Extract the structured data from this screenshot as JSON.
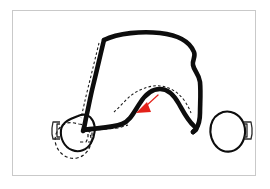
{
  "figure": {
    "title": "Transpalatal arch appliance diagram",
    "background_color": "#ffffff",
    "frame": {
      "border_color": "#c9c9c9",
      "x": 12,
      "y": 10,
      "width": 244,
      "height": 166
    },
    "colors": {
      "wire": "#0d0d0d",
      "band_outline": "#0d0d0d",
      "ghost_dashed": "#1a1a1a",
      "arrow": "#e32119",
      "frame": "#c9c9c9",
      "background": "#ffffff"
    },
    "elements": {
      "main_wire_label": "palatal arch wire",
      "left_band_label": "left molar band",
      "right_band_label": "right molar band",
      "left_band_tab_label": "left band attachment tab",
      "right_band_tab_label": "right band attachment tab",
      "ghost_arch_label": "dashed outline of original wire position",
      "ghost_left_limb_label": "dashed outline of original left arm position",
      "ghost_left_band_label": "dashed outline of original left band position",
      "ghost_lower_left_label": "dashed outline of original lower left wire run",
      "arrow_label": "red direction-of-force arrow",
      "arrow_direction": "up-left"
    },
    "geometry": {
      "main_wire_path": "M 104 40 C 118 33 142 31 160 33 C 178 35 190 42 194 52 C 196 57 192 60 193 65 C 194 71 199 74 200 82 C 201 93 200 104 200 113 C 200 120 198 126 196 129 L 193 132",
      "left_limb_path": "M 104 40 C 101 52 97 70 93 86 C 90 98 88 110 86 118 C 85 124 84 128 83 131",
      "hump_path": "M 84 130 C 96 128 112 128 122 124 C 130 121 134 112 140 103 C 145 95 152 89 160 89 C 168 89 174 95 179 104 C 184 113 188 121 194 126 C 198 129 196 130 193 132",
      "left_band_ring": "M 78 116 C 84 113 90 115 93 121 C 96 127 95 136 91 143 C 87 150 79 153 72 150 C 64 147 60 138 61 130 C 62 122 70 119 78 116 Z",
      "right_band_ring": "M 223 112 C 231 110 239 114 243 122 C 247 130 245 141 239 147 C 233 153 224 153 218 148 C 212 143 209 134 211 125 C 213 117 217 114 223 112 Z",
      "left_tab_outer": "M 60 122 L 53 122 L 52 128 L 52 134 L 53 139 L 60 139",
      "left_tab_inner": "M 60 124 L 57 124 L 57 137 L 60 137",
      "right_tab_outer": "M 244 122 L 251 122 L 252 128 L 252 134 L 251 139 L 244 139",
      "right_tab_inner": "M 244 124 L 247 124 L 247 137 L 244 137",
      "ghost_arch_path": "M 114 112 C 120 107 126 99 133 94 C 142 88 152 85 160 86 C 170 87 178 92 184 100 C 188 106 190 110 191 113",
      "ghost_left_limb_path": "M 99 43 C 96 55 92 72 88 88 C 85 100 83 110 81 118",
      "ghost_left_band_path": "M 79 124 C 85 124 90 130 91 138 C 92 147 86 156 77 158 C 68 160 59 154 56 145 C 53 136 58 126 67 123 C 71 122 75 123 79 124 Z",
      "ghost_lower_left_path": "M 80 142 L 86 142 L 88 138 L 88 131 L 94 130 L 106 129 L 118 128 L 128 125",
      "ghost_tab_small_path": "M 88 131 L 92 131 L 92 142 L 88 142",
      "arrow_tail_path": "M 158 95 L 146 106",
      "arrow_head_points": "147,102 136,113 151,112"
    }
  }
}
